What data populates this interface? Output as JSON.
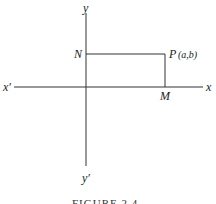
{
  "diagram": {
    "labels": {
      "y_pos": "y",
      "y_neg": "y′",
      "x_pos": "x",
      "x_neg": "x′",
      "N": "N",
      "M": "M",
      "P": "P",
      "P_coords": "(a,b)"
    },
    "caption": "FIGURE 2.4"
  }
}
